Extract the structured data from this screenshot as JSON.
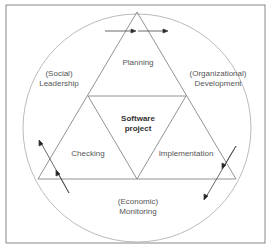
{
  "diagram": {
    "center_label": {
      "line1": "Software",
      "line2": "project"
    },
    "phases": {
      "top": "Planning",
      "left": "Checking",
      "right": "Implementation"
    },
    "outer": {
      "top_left": {
        "line1": "(Social)",
        "line2": "Leadership"
      },
      "top_right": {
        "line1": "(Organizational)",
        "line2": "Development"
      },
      "bottom": {
        "line1": "(Economic)",
        "line2": "Monitoring"
      }
    }
  }
}
